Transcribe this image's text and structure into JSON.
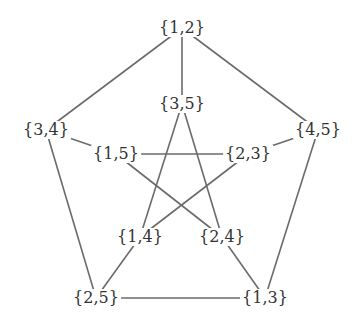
{
  "diagram": {
    "title": "",
    "type": "graph",
    "edge_color": "#6b6b6b",
    "label_color": "#333333",
    "nodes": [
      {
        "id": "12",
        "label": "{1,2}",
        "x": 182,
        "y": 28
      },
      {
        "id": "35",
        "label": "{3,5}",
        "x": 182,
        "y": 104
      },
      {
        "id": "34",
        "label": "{3,4}",
        "x": 46,
        "y": 130
      },
      {
        "id": "45",
        "label": "{4,5}",
        "x": 318,
        "y": 130
      },
      {
        "id": "15",
        "label": "{1,5}",
        "x": 116,
        "y": 154
      },
      {
        "id": "23",
        "label": "{2,3}",
        "x": 248,
        "y": 154
      },
      {
        "id": "14",
        "label": "{1,4}",
        "x": 140,
        "y": 237
      },
      {
        "id": "24",
        "label": "{2,4}",
        "x": 222,
        "y": 237
      },
      {
        "id": "25",
        "label": "{2,5}",
        "x": 96,
        "y": 298
      },
      {
        "id": "13",
        "label": "{1,3}",
        "x": 265,
        "y": 298
      }
    ],
    "edges": [
      {
        "from": "12",
        "to": "34"
      },
      {
        "from": "12",
        "to": "35"
      },
      {
        "from": "12",
        "to": "45"
      },
      {
        "from": "34",
        "to": "15"
      },
      {
        "from": "34",
        "to": "25"
      },
      {
        "from": "45",
        "to": "23"
      },
      {
        "from": "45",
        "to": "13"
      },
      {
        "from": "25",
        "to": "13"
      },
      {
        "from": "25",
        "to": "14"
      },
      {
        "from": "13",
        "to": "24"
      },
      {
        "from": "35",
        "to": "14"
      },
      {
        "from": "35",
        "to": "24"
      },
      {
        "from": "15",
        "to": "23"
      },
      {
        "from": "15",
        "to": "24"
      },
      {
        "from": "23",
        "to": "14"
      }
    ]
  }
}
